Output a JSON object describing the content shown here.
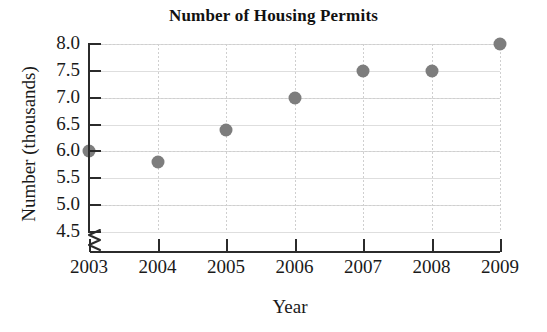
{
  "chart_data": {
    "type": "scatter",
    "title": "Number of Housing Permits",
    "xlabel": "Year",
    "ylabel": "Number (thousands)",
    "x": [
      2003,
      2004,
      2005,
      2006,
      2007,
      2008,
      2009
    ],
    "categories": [
      "2003",
      "2004",
      "2005",
      "2006",
      "2007",
      "2008",
      "2009"
    ],
    "values": [
      6.0,
      5.8,
      6.4,
      7.0,
      7.5,
      7.5,
      8.0
    ],
    "series": [
      {
        "name": "Number of Housing Permits",
        "values": [
          6.0,
          5.8,
          6.4,
          7.0,
          7.5,
          7.5,
          8.0
        ]
      }
    ],
    "ylim": [
      4.5,
      8.0
    ],
    "yticks": [
      4.5,
      5.0,
      5.5,
      6.0,
      6.5,
      7.0,
      7.5,
      8.0
    ],
    "ytick_labels": [
      "4.5",
      "5.0",
      "5.5",
      "6.0",
      "6.5",
      "7.0",
      "7.5",
      "8.0"
    ],
    "xtick_labels": [
      "2003",
      "2004",
      "2005",
      "2006",
      "2007",
      "2008",
      "2009"
    ],
    "grid": true,
    "legend": null,
    "y_axis_break": true,
    "marker_color": "#7d7d7d",
    "grid_color": "#cfcfcf",
    "axis_color": "#2b2b2b"
  }
}
